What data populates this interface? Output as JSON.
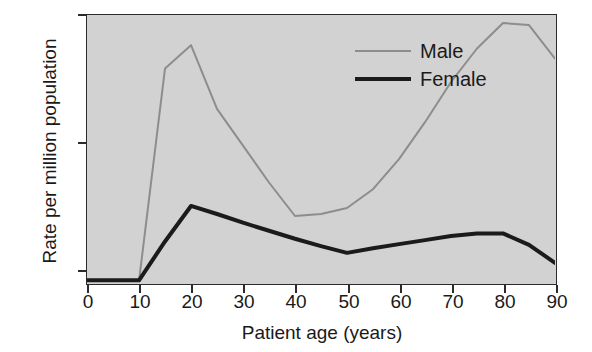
{
  "chart_data": {
    "type": "line",
    "title": "",
    "subtitle": "",
    "xlabel": "Patient age (years)",
    "ylabel": "Rate per million population",
    "xlim": [
      0,
      90
    ],
    "ylim": [
      0,
      400
    ],
    "xticks": [
      0,
      10,
      20,
      30,
      40,
      50,
      60,
      70,
      80,
      90
    ],
    "xtick_labels": [
      "0",
      "10",
      "20",
      "30",
      "40",
      "50",
      "60",
      "70",
      "80",
      "90"
    ],
    "yticks": [
      0,
      200,
      400
    ],
    "ytick_labels": [
      "0",
      "200",
      "400"
    ],
    "grid": false,
    "legend_position": "top-right",
    "x": [
      0,
      5,
      10,
      15,
      20,
      25,
      30,
      35,
      40,
      45,
      50,
      55,
      60,
      65,
      70,
      75,
      80,
      85,
      90
    ],
    "series": [
      {
        "name": "Male",
        "color": "#8d8d8d",
        "line_width": 2,
        "values": [
          3,
          3,
          3,
          320,
          355,
          260,
          205,
          150,
          100,
          103,
          112,
          140,
          185,
          240,
          300,
          350,
          388,
          385,
          335
        ]
      },
      {
        "name": "Female",
        "color": "#1b1b1b",
        "line_width": 4,
        "values": [
          4,
          4,
          4,
          62,
          115,
          103,
          90,
          78,
          66,
          55,
          45,
          52,
          58,
          64,
          70,
          74,
          74,
          57,
          30
        ]
      }
    ],
    "legend": [
      {
        "label": "Male",
        "color": "#8d8d8d",
        "line_width": 2
      },
      {
        "label": "Female",
        "color": "#1b1b1b",
        "line_width": 4
      }
    ],
    "plot_background": "#d2d2d2",
    "axis_color": "#2b2b2b"
  }
}
